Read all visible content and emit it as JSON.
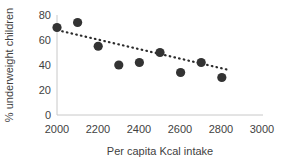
{
  "chart_data": {
    "type": "scatter",
    "title": "",
    "xlabel": "Per capita Kcal intake",
    "ylabel": "% underweight children",
    "xlim": [
      2000,
      3000
    ],
    "ylim": [
      0,
      80
    ],
    "xticks": [
      2000,
      2200,
      2400,
      2600,
      2800,
      3000
    ],
    "xtick_labels": [
      "2000",
      "2200",
      "2400",
      "2600",
      "2800",
      "3000"
    ],
    "yticks": [
      0,
      20,
      40,
      60,
      80
    ],
    "ytick_labels": [
      "0",
      "20",
      "40",
      "60",
      "80"
    ],
    "grid": false,
    "legend": false,
    "marker_color": "#333333",
    "marker_style": "circle",
    "series": [
      {
        "name": "countries",
        "x": [
          2000,
          2100,
          2200,
          2300,
          2400,
          2500,
          2600,
          2700,
          2800
        ],
        "y": [
          70,
          74,
          55,
          40,
          42,
          50,
          34,
          42,
          30
        ]
      }
    ],
    "trendline": {
      "style": "dotted",
      "color": "#2b2b2b",
      "x": [
        2025,
        2835
      ],
      "y": [
        67,
        36
      ]
    }
  },
  "axis": {
    "x_title": "Per capita Kcal intake",
    "y_title": "% underweight children",
    "x_labels": [
      "2000",
      "2200",
      "2400",
      "2600",
      "2800",
      "3000"
    ],
    "y_labels": [
      "80",
      "60",
      "40",
      "20",
      "0"
    ]
  },
  "colors": {
    "marker": "#333333",
    "trendline": "#2b2b2b",
    "axis": "#bfbfbf",
    "text": "#3f3f3f",
    "background": "#ffffff"
  }
}
